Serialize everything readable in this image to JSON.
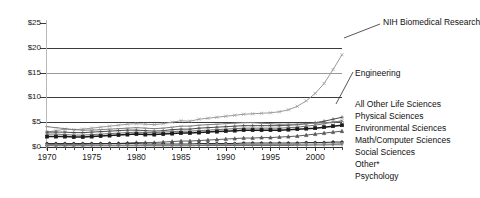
{
  "chart_data": {
    "type": "line",
    "title": "",
    "subtitle": "",
    "xlabel": "",
    "ylabel": "",
    "xlim": [
      1970,
      2003
    ],
    "ylim": [
      0,
      25
    ],
    "grid": true,
    "legend_position": "right-outside-annotations",
    "y_tick_labels": [
      "$25",
      "$20",
      "$15",
      "$10",
      "$5",
      "$0"
    ],
    "y_tick_values": [
      25,
      20,
      15,
      10,
      5,
      0
    ],
    "x_tick_labels": [
      "1970",
      "1975",
      "1980",
      "1985",
      "1990",
      "1995",
      "2000"
    ],
    "x_tick_values": [
      1970,
      1975,
      1980,
      1985,
      1990,
      1995,
      2000
    ],
    "x": [
      1970,
      1971,
      1972,
      1973,
      1974,
      1975,
      1976,
      1977,
      1978,
      1979,
      1980,
      1981,
      1982,
      1983,
      1984,
      1985,
      1986,
      1987,
      1988,
      1989,
      1990,
      1991,
      1992,
      1993,
      1994,
      1995,
      1996,
      1997,
      1998,
      1999,
      2000,
      2001,
      2002,
      2003
    ],
    "series": [
      {
        "name": "NIH Biomedical Research",
        "color": "#9a9a9a",
        "marker": "x",
        "values": [
          3.0,
          3.3,
          3.6,
          3.5,
          3.6,
          3.8,
          4.0,
          4.2,
          4.4,
          4.6,
          4.7,
          4.6,
          4.5,
          4.7,
          5.0,
          5.3,
          5.2,
          5.6,
          5.8,
          6.0,
          6.2,
          6.4,
          6.6,
          6.7,
          6.8,
          6.9,
          7.1,
          7.5,
          8.2,
          9.3,
          10.8,
          12.8,
          15.6,
          18.6
        ]
      },
      {
        "name": "Engineering",
        "color": "#4a4a4a",
        "marker": "plus",
        "values": [
          3.0,
          3.0,
          3.0,
          2.9,
          2.9,
          3.0,
          3.1,
          3.2,
          3.3,
          3.4,
          3.4,
          3.3,
          3.2,
          3.3,
          3.5,
          3.6,
          3.6,
          3.8,
          3.9,
          4.0,
          4.1,
          4.2,
          4.3,
          4.3,
          4.3,
          4.3,
          4.3,
          4.4,
          4.5,
          4.7,
          4.9,
          5.2,
          5.6,
          6.0
        ]
      },
      {
        "name": "All Other Life Sciences",
        "color": "#6e6e6e",
        "marker": "x",
        "values": [
          2.6,
          2.6,
          2.5,
          2.4,
          2.4,
          2.5,
          2.6,
          2.7,
          2.8,
          2.9,
          3.0,
          2.9,
          2.9,
          3.0,
          3.1,
          3.2,
          3.2,
          3.3,
          3.4,
          3.5,
          3.6,
          3.7,
          3.8,
          3.8,
          3.8,
          3.8,
          3.8,
          3.9,
          4.0,
          4.2,
          4.4,
          4.7,
          5.0,
          5.3
        ]
      },
      {
        "name": "Physical Sciences",
        "color": "#808080",
        "marker": "dash",
        "values": [
          4.1,
          3.9,
          3.7,
          3.5,
          3.4,
          3.4,
          3.5,
          3.6,
          3.7,
          3.8,
          3.9,
          3.8,
          3.7,
          3.8,
          4.0,
          4.2,
          4.2,
          4.4,
          4.5,
          4.6,
          4.7,
          4.8,
          4.9,
          4.9,
          4.8,
          4.7,
          4.6,
          4.6,
          4.6,
          4.7,
          4.8,
          4.9,
          5.0,
          5.1
        ]
      },
      {
        "name": "Environmental Sciences",
        "color": "#1b1b1b",
        "marker": "square",
        "values": [
          2.1,
          2.1,
          2.1,
          2.0,
          2.0,
          2.1,
          2.2,
          2.3,
          2.4,
          2.5,
          2.6,
          2.5,
          2.5,
          2.6,
          2.7,
          2.8,
          2.8,
          2.9,
          3.0,
          3.1,
          3.2,
          3.3,
          3.4,
          3.4,
          3.4,
          3.4,
          3.4,
          3.5,
          3.6,
          3.7,
          3.8,
          4.0,
          4.2,
          4.4
        ]
      },
      {
        "name": "Math/Computer Sciences",
        "color": "#5a5a5a",
        "marker": "triangle",
        "values": [
          0.5,
          0.5,
          0.5,
          0.5,
          0.5,
          0.6,
          0.6,
          0.7,
          0.7,
          0.8,
          0.9,
          0.9,
          0.9,
          1.0,
          1.1,
          1.2,
          1.2,
          1.3,
          1.4,
          1.5,
          1.6,
          1.7,
          1.8,
          1.8,
          1.9,
          1.9,
          2.0,
          2.1,
          2.2,
          2.4,
          2.6,
          2.8,
          3.0,
          3.2
        ]
      },
      {
        "name": "Social Sciences",
        "color": "#2e2e2e",
        "marker": "dot",
        "values": [
          0.7,
          0.7,
          0.7,
          0.7,
          0.7,
          0.7,
          0.7,
          0.7,
          0.7,
          0.7,
          0.7,
          0.6,
          0.6,
          0.6,
          0.6,
          0.6,
          0.6,
          0.7,
          0.7,
          0.7,
          0.7,
          0.7,
          0.8,
          0.8,
          0.8,
          0.8,
          0.8,
          0.8,
          0.8,
          0.9,
          0.9,
          0.9,
          1.0,
          1.0
        ]
      },
      {
        "name": "Other*",
        "color": "#8d8d8d",
        "marker": "dot",
        "values": [
          0.4,
          0.4,
          0.4,
          0.4,
          0.4,
          0.4,
          0.4,
          0.4,
          0.4,
          0.4,
          0.4,
          0.4,
          0.4,
          0.4,
          0.4,
          0.4,
          0.4,
          0.4,
          0.5,
          0.5,
          0.5,
          0.5,
          0.5,
          0.5,
          0.5,
          0.5,
          0.5,
          0.5,
          0.5,
          0.6,
          0.6,
          0.6,
          0.6,
          0.7
        ]
      },
      {
        "name": "Psychology",
        "color": "#707070",
        "marker": "tick",
        "values": [
          0.25,
          0.25,
          0.25,
          0.25,
          0.25,
          0.25,
          0.25,
          0.25,
          0.25,
          0.25,
          0.25,
          0.25,
          0.25,
          0.25,
          0.25,
          0.25,
          0.25,
          0.3,
          0.3,
          0.3,
          0.3,
          0.3,
          0.3,
          0.3,
          0.3,
          0.3,
          0.3,
          0.3,
          0.35,
          0.35,
          0.4,
          0.4,
          0.45,
          0.45
        ]
      }
    ]
  },
  "annotations": [
    {
      "label": "NIH Biomedical Research",
      "x": 383,
      "y": 17
    },
    {
      "label": "Engineering",
      "x": 355,
      "y": 68
    },
    {
      "label": "All Other Life Sciences",
      "x": 355,
      "y": 99
    },
    {
      "label": "Physical Sciences",
      "x": 355,
      "y": 111
    },
    {
      "label": "Environmental Sciences",
      "x": 355,
      "y": 123
    },
    {
      "label": "Math/Computer Sciences",
      "x": 355,
      "y": 135
    },
    {
      "label": "Social Sciences",
      "x": 355,
      "y": 147
    },
    {
      "label": "Other*",
      "x": 355,
      "y": 159
    },
    {
      "label": "Psychology",
      "x": 355,
      "y": 171
    }
  ],
  "colors": {
    "background": "#ffffff",
    "axis": "#2b2b2b",
    "grid": "#3a3a3a",
    "text": "#111111"
  }
}
